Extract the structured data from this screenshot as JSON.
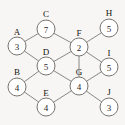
{
  "diagram": {
    "kind": "node-link-graph",
    "node_radius": 9,
    "colors": {
      "background": "#f7f6f4",
      "node_fill": "#ffffff",
      "node_stroke": "#77746f",
      "edge_stroke": "#8a8884",
      "text": "#15130f"
    }
  },
  "chart_data": {
    "type": "diagram",
    "title": "",
    "nodes": [
      {
        "id": "A",
        "label": "A",
        "value": "3",
        "x": 17,
        "y": 46,
        "label_x": 17,
        "label_y": 32
      },
      {
        "id": "C",
        "label": "C",
        "value": "7",
        "x": 46,
        "y": 29,
        "label_x": 46,
        "label_y": 14
      },
      {
        "id": "D",
        "label": "D",
        "value": "5",
        "x": 46,
        "y": 66,
        "label_x": 46,
        "label_y": 52
      },
      {
        "id": "B",
        "label": "B",
        "value": "4",
        "x": 17,
        "y": 87,
        "label_x": 17,
        "label_y": 72
      },
      {
        "id": "E",
        "label": "E",
        "value": "4",
        "x": 46,
        "y": 107,
        "label_x": 46,
        "label_y": 93
      },
      {
        "id": "F",
        "label": "F",
        "value": "2",
        "x": 79,
        "y": 47,
        "label_x": 79,
        "label_y": 33
      },
      {
        "id": "G",
        "label": "G",
        "value": "4",
        "x": 79,
        "y": 86,
        "label_x": 79,
        "label_y": 72
      },
      {
        "id": "H",
        "label": "H",
        "value": "5",
        "x": 109,
        "y": 28,
        "label_x": 109,
        "label_y": 13
      },
      {
        "id": "I",
        "label": "I",
        "value": "5",
        "x": 109,
        "y": 67,
        "label_x": 109,
        "label_y": 53
      },
      {
        "id": "J",
        "label": "J",
        "value": "3",
        "x": 109,
        "y": 107,
        "label_x": 109,
        "label_y": 92
      }
    ],
    "edges": [
      {
        "from": "A",
        "to": "C"
      },
      {
        "from": "A",
        "to": "D"
      },
      {
        "from": "C",
        "to": "F"
      },
      {
        "from": "D",
        "to": "F"
      },
      {
        "from": "D",
        "to": "B"
      },
      {
        "from": "D",
        "to": "G"
      },
      {
        "from": "B",
        "to": "E"
      },
      {
        "from": "E",
        "to": "G"
      },
      {
        "from": "F",
        "to": "G"
      },
      {
        "from": "F",
        "to": "H"
      },
      {
        "from": "F",
        "to": "I"
      },
      {
        "from": "I",
        "to": "G"
      },
      {
        "from": "G",
        "to": "J"
      }
    ]
  }
}
